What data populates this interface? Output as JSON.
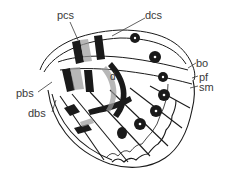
{
  "diagram": {
    "labels": {
      "pcs": "pcs",
      "dcs": "dcs",
      "bo": "bo",
      "pf": "pf",
      "sm": "sm",
      "pbs": "pbs",
      "dbs": "dbs",
      "d": "d"
    },
    "colors": {
      "ink": "#1a1a1a",
      "stipple": "#8a8a8a",
      "label": "#3a3a3a",
      "background": "#ffffff"
    }
  }
}
